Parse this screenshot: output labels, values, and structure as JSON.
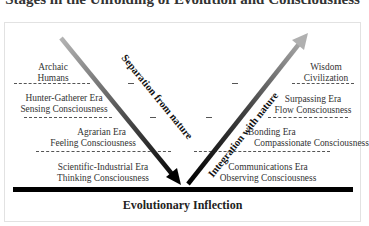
{
  "title": "Stages in the Unfolding of Evolution and Consciousness",
  "footer": "Evolutionary Inflection",
  "arrows": {
    "left": {
      "label": "Separation from nature",
      "direction": "down-right",
      "gradient": [
        "#b0b0b0",
        "#000000"
      ]
    },
    "right": {
      "label": "Integration with nature",
      "direction": "up-right",
      "gradient": [
        "#000000",
        "#b0b0b0"
      ]
    }
  },
  "left_stages": [
    {
      "line1": "Archaic",
      "line2": "Humans"
    },
    {
      "line1": "Hunter-Gatherer Era",
      "line2": "Sensing Consciousness"
    },
    {
      "line1": "Agrarian Era",
      "line2": "Feeling Consciousness"
    },
    {
      "line1": "Scientific-Industrial Era",
      "line2": "Thinking Consciousness"
    }
  ],
  "right_stages": [
    {
      "line1": "Wisdom",
      "line2": "Civilization"
    },
    {
      "line1": "Surpassing Era",
      "line2": "Flow Consciousness"
    },
    {
      "line1": "Bonding Era",
      "line2": "Compassionate Consciousness"
    },
    {
      "line1": "Communications Era",
      "line2": "Observing Consciousness"
    }
  ]
}
